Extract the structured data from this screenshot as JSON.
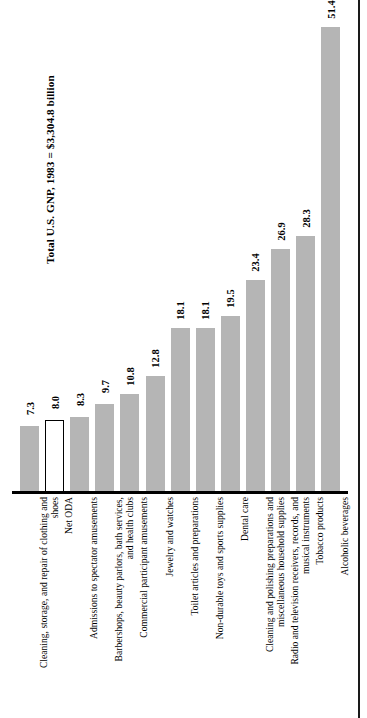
{
  "chart_data": {
    "type": "bar",
    "title": "Total U.S. GNP, 1983 = $3,304.8 billion",
    "xlabel": "",
    "ylabel": "",
    "ylim": [
      0,
      51.4
    ],
    "grid": false,
    "legend": "none",
    "value_unit": "billions of dollars",
    "categories": [
      "Cleaning, storage, and repair of clothing and\nshoes",
      "Net ODA",
      "Admissions to spectator amusements",
      "Barbershops, beauty parlors, bath services,\nand health clubs",
      "Commercial participant amusements",
      "Jewelry and watches",
      "Toilet articles and preparations",
      "Non-durable toys and sports supplies",
      "Dental care",
      "Cleaning and polishing preparations and\nmiscellaneous household supplies",
      "Radio and television receivers, records, and\nmusical instruments",
      "Tobacco products",
      "Alcoholic beverages"
    ],
    "values": [
      7.3,
      8.0,
      8.3,
      9.7,
      10.8,
      12.8,
      18.1,
      18.1,
      19.5,
      23.4,
      26.9,
      28.3,
      51.4
    ],
    "value_labels": [
      "7.3",
      "8.0",
      "8.3",
      "9.7",
      "10.8",
      "12.8",
      "18.1",
      "18.1",
      "19.5",
      "23.4",
      "26.9",
      "28.3",
      "51.4"
    ],
    "highlighted_index": 1,
    "highlighted_category": "Net ODA",
    "colors": {
      "bar_fill": "#b5b5b5",
      "highlight_fill": "#ffffff",
      "highlight_stroke": "#000000",
      "axis": "#000000",
      "text": "#000000"
    }
  }
}
